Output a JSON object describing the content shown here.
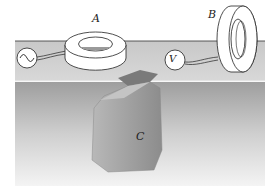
{
  "diagram": {
    "type": "physics-illustration",
    "labels": {
      "coil_a": "A",
      "coil_b": "B",
      "buried_object": "C",
      "voltmeter": "V",
      "ac_source": "~"
    },
    "colors": {
      "background": "#ffffff",
      "ground_top": "#bdbdbd",
      "ground_body": "#a8a8a8",
      "object": "#9a9a9a",
      "outline": "#222222"
    }
  }
}
